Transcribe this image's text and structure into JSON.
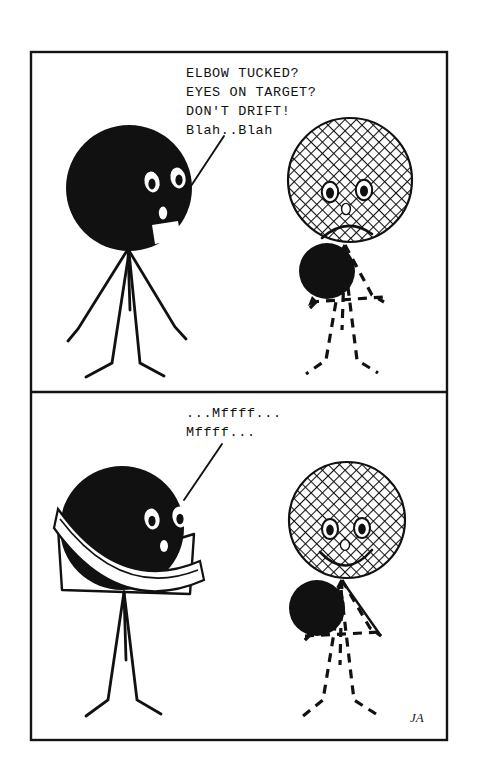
{
  "comic": {
    "title": "Two-panel stick figure cartoon",
    "signature": "JA",
    "ink_color": "#111111",
    "paper_color": "#ffffff",
    "frame": {
      "x": 31,
      "y": 52,
      "width": 416,
      "height": 688,
      "divider_y": 392
    },
    "panels": [
      {
        "id": "panel-1",
        "index": 1,
        "caption_lines": [
          "ELBOW TUCKED?",
          "EYES ON TARGET?",
          "DON'T DRIFT!",
          "Blah..Blah"
        ],
        "caption_x": 186,
        "caption_first_line_y": 77,
        "caption_line_height": 19,
        "pointer": {
          "x1": 224,
          "y1": 136,
          "x2": 191,
          "y2": 186
        },
        "left_figure": {
          "name": "coach-figure",
          "head_fill": "solid-black",
          "expression": "talking",
          "head": {
            "cx": 129,
            "cy": 188,
            "r": 63
          },
          "body_style": "solid-lines"
        },
        "right_figure": {
          "name": "student-figure",
          "head_fill": "crosshatch",
          "expression": "frowning",
          "head": {
            "cx": 350,
            "cy": 180,
            "r": 62
          },
          "body_style": "dashed-lines",
          "ball": {
            "cx": 327,
            "cy": 271,
            "r": 28,
            "fill": "solid-black"
          }
        }
      },
      {
        "id": "panel-2",
        "index": 2,
        "caption_lines": [
          "...Mffff...",
          "Mffff..."
        ],
        "caption_x": 186,
        "caption_first_line_y": 417,
        "caption_line_height": 19,
        "pointer": {
          "x1": 222,
          "y1": 444,
          "x2": 184,
          "y2": 500
        },
        "left_figure": {
          "name": "gagged-coach-figure",
          "head_fill": "solid-black",
          "expression": "gagged",
          "head": {
            "cx": 122,
            "cy": 528,
            "r": 62
          },
          "gag": "white-bandage-wrap",
          "body_style": "solid-lines-arms-raised"
        },
        "right_figure": {
          "name": "happy-student-figure",
          "head_fill": "crosshatch",
          "expression": "smiling",
          "head": {
            "cx": 347,
            "cy": 520,
            "r": 58
          },
          "body_style": "dashed-lines",
          "ball": {
            "cx": 317,
            "cy": 608,
            "r": 28,
            "fill": "solid-black"
          }
        }
      }
    ]
  }
}
